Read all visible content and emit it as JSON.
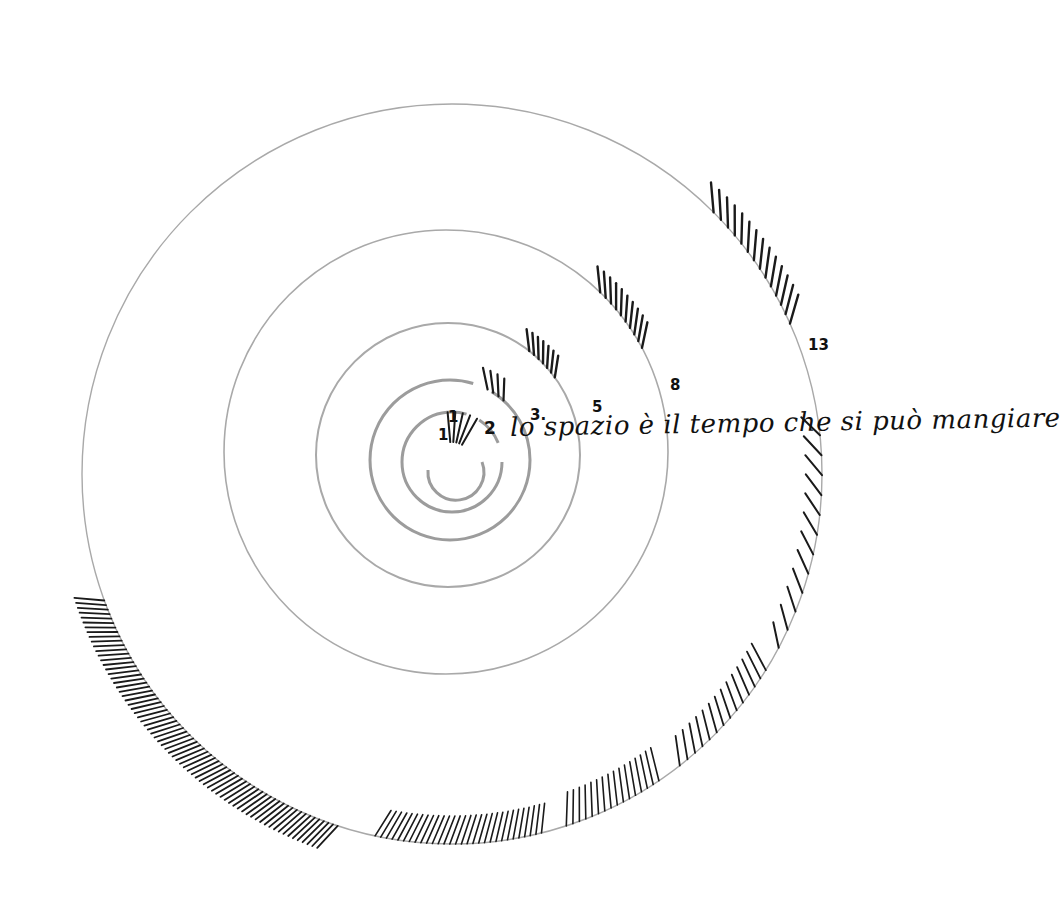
{
  "artwork": {
    "type": "fibonacci-spiral-drawing",
    "phrase": "lo spazio è il tempo che si può mangiare",
    "numbers": [
      "1",
      "1",
      "2",
      "3",
      "5",
      "8",
      "13"
    ],
    "colors": {
      "ring": "#a9a9a9",
      "ink": "#1a1a1a",
      "background": "#ffffff"
    }
  },
  "labels": {
    "n1a": "1",
    "n1b": "1",
    "n2": "2",
    "n3": "3.",
    "n5": "5",
    "n8": "8",
    "n13": "13",
    "phrase": "lo spazio è il tempo che si può mangiare"
  }
}
